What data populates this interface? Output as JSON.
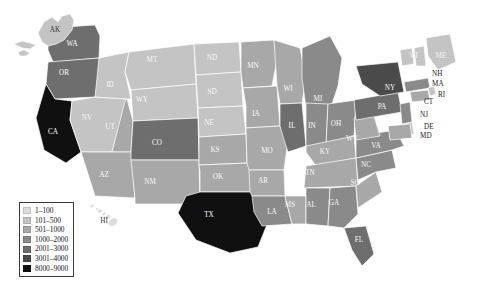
{
  "figure": {
    "caption": "",
    "background_color": "#ffffff"
  },
  "legend": {
    "title": "",
    "border_color": "#3a3a3a",
    "entries": [
      {
        "label": "1–100",
        "color": "#dcdcdc",
        "min": 1,
        "max": 100
      },
      {
        "label": "101–500",
        "color": "#c4c4c4",
        "min": 101,
        "max": 500
      },
      {
        "label": "501–1000",
        "color": "#a8a8a8",
        "min": 501,
        "max": 1000
      },
      {
        "label": "1000–2000",
        "color": "#8a8a8a",
        "min": 1000,
        "max": 2000
      },
      {
        "label": "2001–3000",
        "color": "#6e6e6e",
        "min": 2001,
        "max": 3000
      },
      {
        "label": "3001–4000",
        "color": "#4a4a4a",
        "min": 3001,
        "max": 4000
      },
      {
        "label": "8000–9000",
        "color": "#101010",
        "min": 8000,
        "max": 9000
      }
    ]
  },
  "insets": [
    {
      "name": "alaska",
      "label": "AK",
      "bin": 1
    },
    {
      "name": "hawaii",
      "label": "HI",
      "bin": 0
    }
  ],
  "chart_data": {
    "type": "heatmap",
    "title": "",
    "subtitle": "",
    "xlabel": "",
    "ylabel": "",
    "grid": false,
    "legend_position": "bottom-left",
    "color_scale": [
      "#dcdcdc",
      "#c4c4c4",
      "#a8a8a8",
      "#8a8a8a",
      "#6e6e6e",
      "#4a4a4a",
      "#101010"
    ],
    "bin_labels": [
      "1–100",
      "101–500",
      "501–1000",
      "1000–2000",
      "2001–3000",
      "3001–4000",
      "8000–9000"
    ],
    "categories": [
      "AL",
      "AK",
      "AZ",
      "AR",
      "CA",
      "CO",
      "CT",
      "DE",
      "FL",
      "GA",
      "HI",
      "ID",
      "IL",
      "IN",
      "IA",
      "KS",
      "KY",
      "LA",
      "ME",
      "MD",
      "MA",
      "MI",
      "MN",
      "MS",
      "MO",
      "MT",
      "NE",
      "NV",
      "NH",
      "NJ",
      "NM",
      "NY",
      "NC",
      "ND",
      "OH",
      "OK",
      "OR",
      "PA",
      "RI",
      "SC",
      "SD",
      "TN",
      "TX",
      "UT",
      "VT",
      "VA",
      "WA",
      "WV",
      "WI",
      "WY"
    ],
    "values": [
      3,
      1,
      2,
      2,
      6,
      4,
      2,
      1,
      4,
      3,
      0,
      1,
      4,
      3,
      2,
      2,
      2,
      3,
      1,
      2,
      3,
      3,
      2,
      2,
      2,
      1,
      1,
      1,
      1,
      3,
      2,
      5,
      3,
      1,
      3,
      2,
      4,
      4,
      1,
      2,
      1,
      2,
      6,
      2,
      1,
      3,
      4,
      2,
      2,
      1
    ]
  },
  "states": [
    {
      "code": "WA",
      "bin": 4,
      "label_x": 72,
      "label_y": 44
    },
    {
      "code": "OR",
      "bin": 4,
      "label_x": 64,
      "label_y": 73
    },
    {
      "code": "CA",
      "bin": 6,
      "label_x": 53,
      "label_y": 132
    },
    {
      "code": "NV",
      "bin": 1,
      "label_x": 87,
      "label_y": 118
    },
    {
      "code": "ID",
      "bin": 1,
      "label_x": 110,
      "label_y": 85
    },
    {
      "code": "MT",
      "bin": 1,
      "label_x": 152,
      "label_y": 60
    },
    {
      "code": "WY",
      "bin": 1,
      "label_x": 142,
      "label_y": 100
    },
    {
      "code": "UT",
      "bin": 2,
      "label_x": 110,
      "label_y": 127
    },
    {
      "code": "AZ",
      "bin": 2,
      "label_x": 104,
      "label_y": 175
    },
    {
      "code": "CO",
      "bin": 4,
      "label_x": 157,
      "label_y": 143
    },
    {
      "code": "NM",
      "bin": 2,
      "label_x": 150,
      "label_y": 182
    },
    {
      "code": "ND",
      "bin": 1,
      "label_x": 212,
      "label_y": 58
    },
    {
      "code": "SD",
      "bin": 1,
      "label_x": 212,
      "label_y": 92
    },
    {
      "code": "NE",
      "bin": 1,
      "label_x": 209,
      "label_y": 123
    },
    {
      "code": "KS",
      "bin": 2,
      "label_x": 215,
      "label_y": 150
    },
    {
      "code": "OK",
      "bin": 2,
      "label_x": 218,
      "label_y": 177
    },
    {
      "code": "TX",
      "bin": 6,
      "label_x": 209,
      "label_y": 215
    },
    {
      "code": "MN",
      "bin": 2,
      "label_x": 253,
      "label_y": 66
    },
    {
      "code": "IA",
      "bin": 2,
      "label_x": 256,
      "label_y": 114
    },
    {
      "code": "MO",
      "bin": 2,
      "label_x": 267,
      "label_y": 151
    },
    {
      "code": "AR",
      "bin": 2,
      "label_x": 263,
      "label_y": 181
    },
    {
      "code": "LA",
      "bin": 3,
      "label_x": 272,
      "label_y": 212
    },
    {
      "code": "WI",
      "bin": 2,
      "label_x": 288,
      "label_y": 89
    },
    {
      "code": "IL",
      "bin": 4,
      "label_x": 292,
      "label_y": 126
    },
    {
      "code": "MS",
      "bin": 2,
      "label_x": 290,
      "label_y": 205
    },
    {
      "code": "MI",
      "bin": 3,
      "label_x": 318,
      "label_y": 99
    },
    {
      "code": "IN",
      "bin": 3,
      "label_x": 312,
      "label_y": 126
    },
    {
      "code": "TN",
      "bin": 2,
      "label_x": 310,
      "label_y": 173
    },
    {
      "code": "AL",
      "bin": 3,
      "label_x": 311,
      "label_y": 205
    },
    {
      "code": "KY",
      "bin": 2,
      "label_x": 325,
      "label_y": 152
    },
    {
      "code": "OH",
      "bin": 3,
      "label_x": 336,
      "label_y": 124
    },
    {
      "code": "GA",
      "bin": 3,
      "label_x": 334,
      "label_y": 203
    },
    {
      "code": "WV",
      "bin": 2,
      "label_x": 352,
      "label_y": 139
    },
    {
      "code": "FL",
      "bin": 4,
      "label_x": 359,
      "label_y": 240
    },
    {
      "code": "SC",
      "bin": 2,
      "label_x": 355,
      "label_y": 183
    },
    {
      "code": "NC",
      "bin": 3,
      "label_x": 366,
      "label_y": 165
    },
    {
      "code": "VA",
      "bin": 3,
      "label_x": 376,
      "label_y": 146
    },
    {
      "code": "PA",
      "bin": 4,
      "label_x": 382,
      "label_y": 107
    },
    {
      "code": "NY",
      "bin": 5,
      "label_x": 390,
      "label_y": 88
    },
    {
      "code": "VT",
      "bin": 1,
      "label_x": 414,
      "label_y": 56
    },
    {
      "code": "ME",
      "bin": 1,
      "label_x": 441,
      "label_y": 56
    }
  ],
  "callouts": [
    {
      "code": "NH",
      "bin": 1,
      "label_x": 432,
      "label_y": 74
    },
    {
      "code": "MA",
      "bin": 3,
      "label_x": 432,
      "label_y": 84
    },
    {
      "code": "RI",
      "bin": 1,
      "label_x": 438,
      "label_y": 95
    },
    {
      "code": "CT",
      "bin": 2,
      "label_x": 424,
      "label_y": 102
    },
    {
      "code": "NJ",
      "bin": 3,
      "label_x": 420,
      "label_y": 115
    },
    {
      "code": "DE",
      "bin": 1,
      "label_x": 424,
      "label_y": 127
    },
    {
      "code": "MD",
      "bin": 2,
      "label_x": 420,
      "label_y": 136
    }
  ]
}
